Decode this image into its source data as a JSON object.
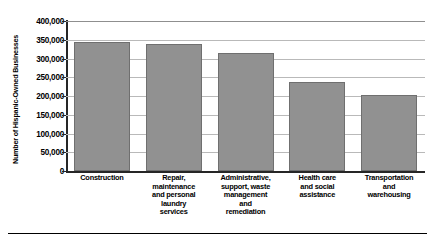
{
  "chart_data": {
    "type": "bar",
    "title": "",
    "xlabel": "",
    "ylabel": "Number of Hispanic-Owned Businesses",
    "ylim": [
      0,
      400000
    ],
    "grid": true,
    "legend": "none",
    "orientation": "vertical",
    "bar_color": "#919191",
    "categories": [
      "Construction",
      "Repair, maintenance and personal laundry services",
      "Administrative, support, waste management and remediation",
      "Health care and social assistance",
      "Transportation and warehousing"
    ],
    "category_lines": [
      [
        "Construction"
      ],
      [
        "Repair,",
        "maintenance",
        "and personal",
        "laundry",
        "services"
      ],
      [
        "Administrative,",
        "support, waste",
        "management",
        "and",
        "remediation"
      ],
      [
        "Health care",
        "and social",
        "assistance"
      ],
      [
        "Transportation",
        "and",
        "warehousing"
      ]
    ],
    "values": [
      343000,
      339000,
      315000,
      238000,
      203000
    ],
    "ytick_labels": [
      "400,000",
      "350,000",
      "300,000",
      "250,000",
      "200,000",
      "150,000",
      "100,000",
      "50,000",
      "0"
    ],
    "ytick_values": [
      400000,
      350000,
      300000,
      250000,
      200000,
      150000,
      100000,
      50000,
      0
    ]
  }
}
